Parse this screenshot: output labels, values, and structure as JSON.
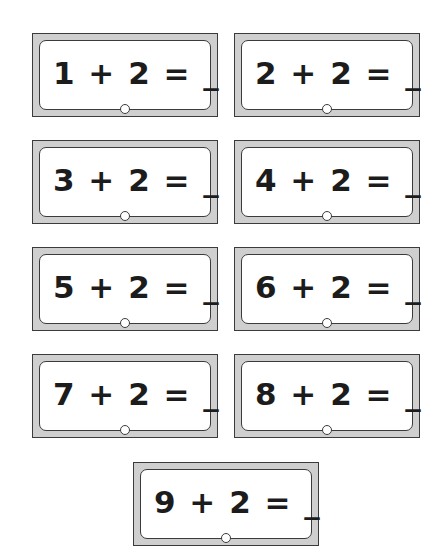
{
  "page": {
    "background_color": "#ffffff",
    "width": 439,
    "height": 560
  },
  "style": {
    "card_band_color": "#cfcfcf",
    "card_border_color": "#3b3b3b",
    "card_inner_fill": "#ffffff",
    "text_color": "#1c1c1c"
  },
  "cards": [
    {
      "equation": "1 + 2 = _",
      "addend_a": 1,
      "operator": "+",
      "addend_b": 2,
      "equals": "=",
      "answer_blank": "_",
      "row": 1,
      "column": 1,
      "x": 32,
      "y": 33
    },
    {
      "equation": "2 + 2 = _",
      "addend_a": 2,
      "operator": "+",
      "addend_b": 2,
      "equals": "=",
      "answer_blank": "_",
      "row": 1,
      "column": 2,
      "x": 234,
      "y": 33
    },
    {
      "equation": "3 + 2 = _",
      "addend_a": 3,
      "operator": "+",
      "addend_b": 2,
      "equals": "=",
      "answer_blank": "_",
      "row": 2,
      "column": 1,
      "x": 32,
      "y": 140
    },
    {
      "equation": "4 + 2 = _",
      "addend_a": 4,
      "operator": "+",
      "addend_b": 2,
      "equals": "=",
      "answer_blank": "_",
      "row": 2,
      "column": 2,
      "x": 234,
      "y": 140
    },
    {
      "equation": "5 + 2 = _",
      "addend_a": 5,
      "operator": "+",
      "addend_b": 2,
      "equals": "=",
      "answer_blank": "_",
      "row": 3,
      "column": 1,
      "x": 32,
      "y": 247
    },
    {
      "equation": "6 + 2 = _",
      "addend_a": 6,
      "operator": "+",
      "addend_b": 2,
      "equals": "=",
      "answer_blank": "_",
      "row": 3,
      "column": 2,
      "x": 234,
      "y": 247
    },
    {
      "equation": "7 + 2 = _",
      "addend_a": 7,
      "operator": "+",
      "addend_b": 2,
      "equals": "=",
      "answer_blank": "_",
      "row": 4,
      "column": 1,
      "x": 32,
      "y": 354
    },
    {
      "equation": "8 + 2 = _",
      "addend_a": 8,
      "operator": "+",
      "addend_b": 2,
      "equals": "=",
      "answer_blank": "_",
      "row": 4,
      "column": 2,
      "x": 234,
      "y": 354
    },
    {
      "equation": "9 + 2 = _",
      "addend_a": 9,
      "operator": "+",
      "addend_b": 2,
      "equals": "=",
      "answer_blank": "_",
      "row": 5,
      "column": 1,
      "x": 133,
      "y": 462
    }
  ]
}
